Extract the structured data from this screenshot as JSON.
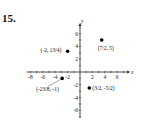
{
  "problem": {
    "number": "15."
  },
  "chart_data": {
    "type": "scatter",
    "title": "",
    "xlabel": "x",
    "ylabel": "y",
    "xlim": [
      -8,
      7
    ],
    "ylim": [
      -7,
      7
    ],
    "grid": false,
    "x_ticks": [
      -8,
      -6,
      -4,
      -2,
      2,
      4,
      6
    ],
    "y_ticks": [
      -6,
      -4,
      -2,
      2,
      4,
      6
    ],
    "x_tick_labels": [
      "-8",
      "-6",
      "-4",
      "-2",
      "2",
      "4",
      "6"
    ],
    "y_tick_labels": [
      "-6",
      "-4",
      "-2",
      "2",
      "4",
      "6"
    ],
    "points": [
      {
        "x": -2,
        "y": 3.25,
        "label": "(-2, 13/4)"
      },
      {
        "x": 3.5,
        "y": 5,
        "label": "(7/2, 5)"
      },
      {
        "x": -2.875,
        "y": -1,
        "label": "(-23/8, -1)"
      },
      {
        "x": 1.5,
        "y": -2.5,
        "label": "(3/2, -5/2)"
      }
    ],
    "marker_color": "#000000"
  }
}
